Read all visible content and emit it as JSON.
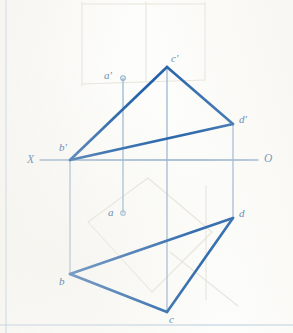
{
  "drawing": {
    "title": "Two-view orthographic projection of triangle ABCD points",
    "stroke_color": "#1f5fa8",
    "thin_stroke_color": "#8fb0cf",
    "ghost_stroke_color": "#e6e4da",
    "axis_color": "#8aa9c8",
    "label_color": "#6d8fb5",
    "background_color": "#fdfdfb",
    "margin_line_color": "#9bb8d4"
  },
  "axis": {
    "name": "ground-line",
    "left_label": "X",
    "right_label": "O",
    "y": 160,
    "x_start": 40,
    "x_end": 258,
    "left_label_x": 27,
    "left_label_y": 154,
    "right_label_x": 264,
    "right_label_y": 153
  },
  "points": [
    {
      "id": "a-prime",
      "label": "a'",
      "x": 123,
      "y": 78,
      "label_x": 104,
      "label_y": 70,
      "marker": "open-circle",
      "view": "frontal"
    },
    {
      "id": "c-prime",
      "label": "c'",
      "x": 167,
      "y": 67,
      "label_x": 171,
      "label_y": 53,
      "marker": "vertex",
      "view": "frontal"
    },
    {
      "id": "d-prime",
      "label": "d'",
      "x": 233,
      "y": 124,
      "label_x": 239,
      "label_y": 114,
      "marker": "vertex",
      "view": "frontal"
    },
    {
      "id": "b-prime",
      "label": "b'",
      "x": 70,
      "y": 160,
      "label_x": 59,
      "label_y": 142,
      "marker": "vertex",
      "view": "frontal"
    },
    {
      "id": "a",
      "label": "a",
      "x": 123,
      "y": 213,
      "label_x": 108,
      "label_y": 207,
      "marker": "open-circle",
      "view": "horizontal"
    },
    {
      "id": "d",
      "label": "d",
      "x": 233,
      "y": 218,
      "label_x": 239,
      "label_y": 208,
      "marker": "vertex",
      "view": "horizontal"
    },
    {
      "id": "b",
      "label": "b",
      "x": 70,
      "y": 274,
      "label_x": 59,
      "label_y": 276,
      "marker": "vertex",
      "view": "horizontal"
    },
    {
      "id": "c",
      "label": "c",
      "x": 167,
      "y": 312,
      "label_x": 169,
      "label_y": 314,
      "marker": "vertex",
      "view": "horizontal"
    }
  ],
  "thick_edges": [
    {
      "name": "edge-bprime-cprime",
      "x1": 70,
      "y1": 160,
      "x2": 167,
      "y2": 67
    },
    {
      "name": "edge-cprime-dprime",
      "x1": 167,
      "y1": 67,
      "x2": 233,
      "y2": 124
    },
    {
      "name": "edge-dprime-bprime",
      "x1": 233,
      "y1": 124,
      "x2": 70,
      "y2": 160
    },
    {
      "name": "edge-b-d",
      "x1": 70,
      "y1": 274,
      "x2": 233,
      "y2": 218
    },
    {
      "name": "edge-d-c",
      "x1": 233,
      "y1": 218,
      "x2": 167,
      "y2": 312
    },
    {
      "name": "edge-c-b",
      "x1": 167,
      "y1": 312,
      "x2": 70,
      "y2": 274
    }
  ],
  "projection_lines": [
    {
      "name": "projector-b",
      "x1": 70,
      "y1": 160,
      "x2": 70,
      "y2": 274
    },
    {
      "name": "projector-a",
      "x1": 123,
      "y1": 78,
      "x2": 123,
      "y2": 213
    },
    {
      "name": "projector-c",
      "x1": 167,
      "y1": 67,
      "x2": 167,
      "y2": 312
    },
    {
      "name": "projector-d",
      "x1": 233,
      "y1": 124,
      "x2": 233,
      "y2": 218
    }
  ],
  "ghost_lines": [
    {
      "name": "ghost-upper-rect-left",
      "x1": 82,
      "y1": 2,
      "x2": 82,
      "y2": 86
    },
    {
      "name": "ghost-upper-rect-right",
      "x1": 205,
      "y1": 2,
      "x2": 205,
      "y2": 80
    },
    {
      "name": "ghost-upper-rect-mid",
      "x1": 146,
      "y1": 2,
      "x2": 146,
      "y2": 82
    },
    {
      "name": "ghost-upper-rect-top",
      "x1": 82,
      "y1": 4,
      "x2": 205,
      "y2": 4
    },
    {
      "name": "ghost-upper-rect-bottom",
      "x1": 82,
      "y1": 84,
      "x2": 205,
      "y2": 80
    },
    {
      "name": "ghost-diag-1",
      "x1": 88,
      "y1": 222,
      "x2": 148,
      "y2": 178
    },
    {
      "name": "ghost-diag-2",
      "x1": 148,
      "y1": 178,
      "x2": 212,
      "y2": 232
    },
    {
      "name": "ghost-diag-3",
      "x1": 212,
      "y1": 232,
      "x2": 152,
      "y2": 292
    },
    {
      "name": "ghost-diag-4",
      "x1": 152,
      "y1": 292,
      "x2": 88,
      "y2": 222
    },
    {
      "name": "ghost-lower-vert",
      "x1": 206,
      "y1": 186,
      "x2": 206,
      "y2": 300
    },
    {
      "name": "ghost-slope-right",
      "x1": 170,
      "y1": 252,
      "x2": 238,
      "y2": 306
    }
  ],
  "page_margins": [
    {
      "name": "left-margin-rule",
      "x1": 6,
      "y1": 0,
      "x2": 6,
      "y2": 333
    },
    {
      "name": "bottom-margin-rule",
      "x1": 0,
      "y1": 325,
      "x2": 293,
      "y2": 325
    }
  ]
}
